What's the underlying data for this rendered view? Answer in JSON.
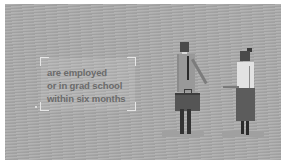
{
  "scene": {
    "caption_lines": [
      "are employed",
      "or in grad school",
      "within six months"
    ],
    "figures": [
      "man-with-briefcase",
      "woman-in-skirt"
    ],
    "colors": {
      "background": "#a9a9a9",
      "text": "#6b6b6b",
      "frame_border": "#ffffff",
      "dark_figure": "#3c3c3c",
      "shirt_light": "#e2e2e2",
      "shirt_mid": "#8d8d8d"
    }
  }
}
